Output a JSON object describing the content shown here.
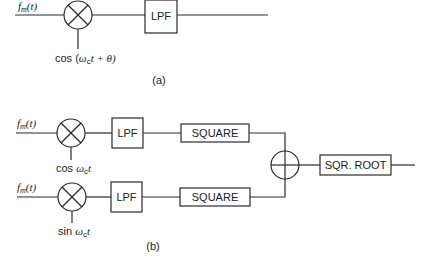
{
  "diagram_a": {
    "input_label": "f_m(t)",
    "input_label_main": "f",
    "input_label_sub": "m",
    "input_label_arg": "(t)",
    "mixer_symbol": "multiplier",
    "oscillator_label_prefix": "cos (",
    "oscillator_label_omega": "ω",
    "oscillator_label_sub": "c",
    "oscillator_label_suffix": "t + θ)",
    "lpf_label": "LPF",
    "caption": "(a)"
  },
  "diagram_b": {
    "branches": [
      {
        "input_label_main": "f",
        "input_label_sub": "m",
        "input_label_arg": "(t)",
        "oscillator_label_prefix": "cos ",
        "oscillator_label_omega": "ω",
        "oscillator_label_sub": "c",
        "oscillator_label_suffix": "t",
        "lpf_label": "LPF",
        "square_label": "SQUARE"
      },
      {
        "input_label_main": "f",
        "input_label_sub": "m",
        "input_label_arg": "(t)",
        "oscillator_label_prefix": "sin ",
        "oscillator_label_omega": "ω",
        "oscillator_label_sub": "c",
        "oscillator_label_suffix": "t",
        "lpf_label": "LPF",
        "square_label": "SQUARE"
      }
    ],
    "summer_symbol": "adder",
    "sqrt_label": "SQR. ROOT",
    "caption": "(b)"
  }
}
